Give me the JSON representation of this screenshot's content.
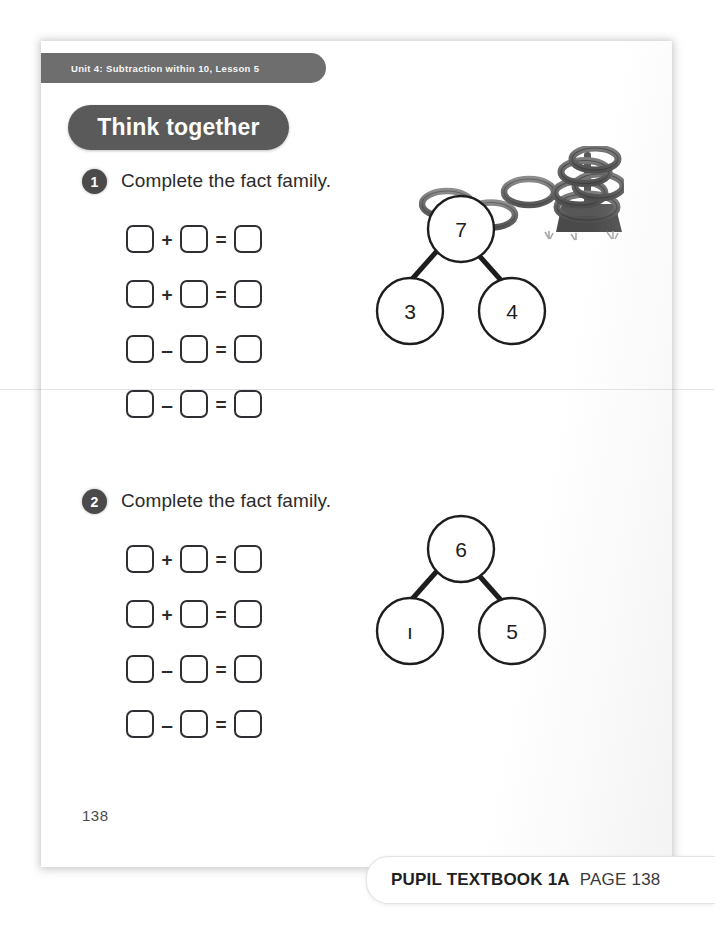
{
  "header": {
    "unit_label": "Unit 4: Subtraction within 10, Lesson 5",
    "section_title": "Think together"
  },
  "questions": [
    {
      "number": "1",
      "prompt": "Complete the fact family.",
      "rows": [
        {
          "op": "+",
          "eq": "="
        },
        {
          "op": "+",
          "eq": "="
        },
        {
          "op": "–",
          "eq": "="
        },
        {
          "op": "–",
          "eq": "="
        }
      ],
      "bond": {
        "whole": "7",
        "part_left": "3",
        "part_right": "4"
      }
    },
    {
      "number": "2",
      "prompt": "Complete the fact family.",
      "rows": [
        {
          "op": "+",
          "eq": "="
        },
        {
          "op": "+",
          "eq": "="
        },
        {
          "op": "–",
          "eq": "="
        },
        {
          "op": "–",
          "eq": "="
        }
      ],
      "bond": {
        "whole": "6",
        "part_left": "ı",
        "part_right": "5"
      }
    }
  ],
  "illustration": {
    "name": "quoits-rings-illustration",
    "description": "grayscale drawing of three loose rings and a stack of rings on a post"
  },
  "footer": {
    "page_folio": "138",
    "caption_strong": "PUPIL TEXTBOOK 1A",
    "caption_light": "PAGE 138"
  },
  "colors": {
    "strip_gray": "#6e6e6e",
    "pill_gray": "#5a5a5a",
    "badge_gray": "#4a4a4a",
    "ink": "#2b2b2b"
  }
}
